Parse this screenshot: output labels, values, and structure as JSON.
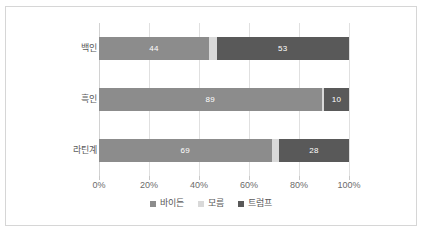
{
  "chart_data": {
    "type": "bar",
    "orientation": "horizontal",
    "stacked": true,
    "title": "",
    "xlabel": "",
    "ylabel": "",
    "categories": [
      "백인",
      "흑인",
      "라틴계"
    ],
    "series": [
      {
        "name": "바이든",
        "color": "#8c8c8c",
        "values": [
          44,
          89,
          69
        ]
      },
      {
        "name": "모름",
        "color": "#d9d9d9",
        "values": [
          3,
          1,
          3
        ]
      },
      {
        "name": "트럼프",
        "color": "#595959",
        "values": [
          53,
          10,
          28
        ]
      }
    ],
    "visible_data_labels": {
      "백인": {
        "바이든": "44",
        "모름": "",
        "트럼프": "53"
      },
      "흑인": {
        "바이든": "89",
        "모름": "",
        "트럼프": "10"
      },
      "라틴계": {
        "바이든": "69",
        "모름": "",
        "트럼프": "28"
      }
    },
    "xlim": [
      0,
      100
    ],
    "xticks": [
      0,
      20,
      40,
      60,
      80,
      100
    ],
    "xtick_labels": [
      "0%",
      "20%",
      "40%",
      "60%",
      "80%",
      "100%"
    ],
    "grid": true,
    "legend_position": "bottom"
  },
  "legend": {
    "items": [
      {
        "label": "바이든",
        "color": "#8c8c8c"
      },
      {
        "label": "모름",
        "color": "#d9d9d9"
      },
      {
        "label": "트럼프",
        "color": "#595959"
      }
    ]
  },
  "axis": {
    "tick_labels": [
      "0%",
      "20%",
      "40%",
      "60%",
      "80%",
      "100%"
    ]
  },
  "categories": {
    "labels": [
      "백인",
      "흑인",
      "라틴계"
    ]
  },
  "colors": {
    "biden": "#8c8c8c",
    "unknown": "#d9d9d9",
    "trump": "#595959",
    "frame_border": "#d6d6d6",
    "gridline": "#e0e0e0",
    "text": "#595959",
    "background": "#ffffff"
  }
}
